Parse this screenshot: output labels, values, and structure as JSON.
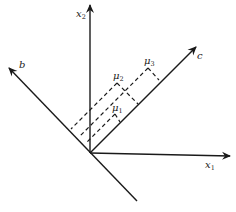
{
  "diagram": {
    "type": "projection-axes",
    "axes": [
      {
        "id": "x1",
        "label": "x",
        "subscript": "1"
      },
      {
        "id": "x2",
        "label": "x",
        "subscript": "2"
      },
      {
        "id": "b",
        "label": "b",
        "subscript": ""
      },
      {
        "id": "c",
        "label": "c",
        "subscript": ""
      }
    ],
    "points": [
      {
        "id": "mu1",
        "label": "μ",
        "subscript": "1"
      },
      {
        "id": "mu2",
        "label": "μ",
        "subscript": "2"
      },
      {
        "id": "mu3",
        "label": "μ",
        "subscript": "3"
      }
    ],
    "colors": {
      "line": "#1a1a1a",
      "background": "#ffffff"
    }
  }
}
